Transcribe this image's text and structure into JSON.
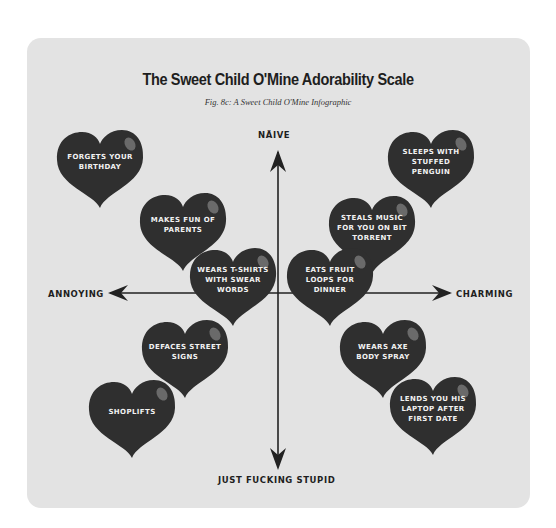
{
  "header": {
    "title": "The Sweet Child O'Mine Adorability Scale",
    "subtitle": "Fig. 8c:  A Sweet Child O'Mine Infographic"
  },
  "axes": {
    "top": "Näive",
    "bottom": "Just Fucking Stupid",
    "left": "Annoying",
    "right": "Charming"
  },
  "colors": {
    "card_background": "#e3e3e3",
    "heart_fill": "#2f2f2f",
    "axis_line": "#222222",
    "heart_text": "#f2f2f2"
  },
  "hearts": [
    {
      "label": "Forgets your birthday",
      "quadrant": "naive-annoying"
    },
    {
      "label": "Makes fun of parents",
      "quadrant": "naive-annoying"
    },
    {
      "label": "Wears T-shirts with swear words",
      "quadrant": "center-annoying"
    },
    {
      "label": "Sleeps with stuffed penguin",
      "quadrant": "naive-charming"
    },
    {
      "label": "Steals music for you on bit torrent",
      "quadrant": "naive-charming"
    },
    {
      "label": "Eats fruit loops for dinner",
      "quadrant": "center-charming"
    },
    {
      "label": "Defaces street signs",
      "quadrant": "stupid-annoying"
    },
    {
      "label": "Shoplifts",
      "quadrant": "stupid-annoying"
    },
    {
      "label": "Wears axe body spray",
      "quadrant": "stupid-charming"
    },
    {
      "label": "Lends you his laptop after first date",
      "quadrant": "stupid-charming"
    }
  ]
}
